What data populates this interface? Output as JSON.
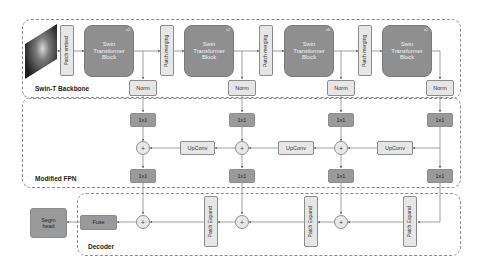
{
  "groups": {
    "backbone": {
      "label": "Swin-T Backbone"
    },
    "fpn": {
      "label": "Modified FPN"
    },
    "decoder": {
      "label": "Decoder"
    }
  },
  "backbone": {
    "patch_embed": "Patch embed",
    "patch_merging": "Patch merging",
    "swin_block_label": "Swin Transformer Block",
    "stages": [
      {
        "label": "Swin Transformer Block",
        "multiplier": "x2"
      },
      {
        "label": "Swin Transformer Block",
        "multiplier": "x2"
      },
      {
        "label": "Swin Transformer Block",
        "multiplier": "x6"
      },
      {
        "label": "Swin Transformer Block",
        "multiplier": "x2"
      }
    ],
    "norm": "Norm"
  },
  "fpn": {
    "conv1x1": "1x1",
    "upconv": "UpConv",
    "plus": "+"
  },
  "decoder": {
    "patch_expand": "Patch Expand",
    "fuse": "Fuse",
    "segm_head": "Segm head",
    "plus": "+"
  },
  "colors": {
    "swin_block": "#8f8f8f",
    "dark_box": "#9a9a9a",
    "light_box": "#e6e6e6",
    "border": "#8c8c8c",
    "arrow": "#666666"
  }
}
